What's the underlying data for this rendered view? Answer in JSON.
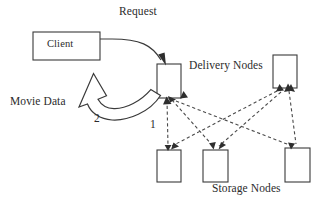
{
  "diagram": {
    "labels": {
      "request": "Request",
      "client": "Client",
      "delivery_nodes": "Delivery Nodes",
      "movie_data": "Movie Data",
      "storage_nodes": "Storage Nodes",
      "step_one": "1",
      "step_two": "2"
    },
    "nodes": {
      "client": {
        "label": "Client",
        "x": 33,
        "y": 32,
        "w": 67,
        "h": 28
      },
      "delivery": [
        {
          "name": "delivery-node-left",
          "x": 157,
          "y": 64,
          "w": 24,
          "h": 34
        },
        {
          "name": "delivery-node-right",
          "x": 273,
          "y": 55,
          "w": 24,
          "h": 33
        }
      ],
      "storage": [
        {
          "name": "storage-node-1",
          "x": 157,
          "y": 150,
          "w": 24,
          "h": 32
        },
        {
          "name": "storage-node-2",
          "x": 203,
          "y": 150,
          "w": 25,
          "h": 32
        },
        {
          "name": "storage-node-3",
          "x": 285,
          "y": 148,
          "w": 25,
          "h": 34
        }
      ]
    },
    "edges": {
      "request_flow": "client-to-delivery-node",
      "movie_data_flow": "delivery-node-to-client",
      "storage_links": "dashed-bidirectional-mesh"
    },
    "colors": {
      "stroke": "#3a3a3a",
      "dashed_stroke": "#4a4a4a",
      "arrowhead": "#2e2e2e",
      "fill": "#ffffff",
      "text": "#2b2b2b"
    }
  }
}
